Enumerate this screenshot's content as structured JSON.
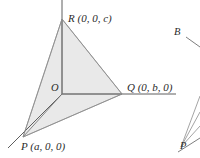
{
  "figure": {
    "canvas": {
      "width": 200,
      "height": 158,
      "background": "#ffffff"
    },
    "colors": {
      "fill": "#e9e9e9",
      "edge": "#8d8d8d",
      "axis": "#6f6f6f",
      "text": "#2b2b2b"
    },
    "labels": {
      "r_vertex": "R (0, 0, c)",
      "q_vertex": "Q (0, b, 0)",
      "p_vertex": "P (a, 0, 0)",
      "origin": "O",
      "fragment_b": "B",
      "fragment_p": "P"
    },
    "points": {
      "origin": {
        "name": "O",
        "x": 62,
        "y": 94,
        "coords": "(0, 0, 0)"
      },
      "r": {
        "name": "R",
        "x": 62,
        "y": 19,
        "coords": "(0, 0, c)"
      },
      "q": {
        "name": "Q",
        "x": 122,
        "y": 94,
        "coords": "(0, b, 0)"
      },
      "p": {
        "name": "P",
        "x": 23,
        "y": 137,
        "coords": "(a, 0, 0)"
      }
    },
    "axes": [
      {
        "name": "z-axis",
        "x1": 62,
        "y1": 0,
        "x2": 62,
        "y2": 94
      },
      {
        "name": "y-axis",
        "x1": 62,
        "y1": 94,
        "x2": 176,
        "y2": 94
      },
      {
        "name": "x-axis",
        "x1": 62,
        "y1": 94,
        "x2": 8,
        "y2": 148
      }
    ],
    "shaded_face": {
      "name": "triangle-PQR",
      "path": "62,19 122,94 23,137"
    }
  }
}
